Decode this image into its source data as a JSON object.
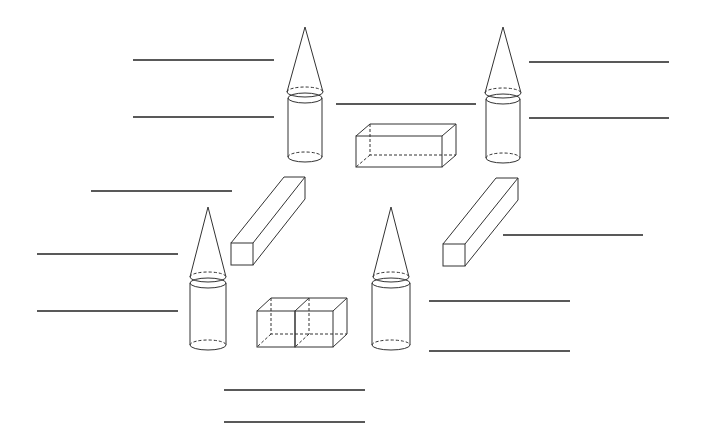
{
  "diagram": {
    "stroke_color": "#333333",
    "background": "#ffffff",
    "shapes": [
      {
        "id": "cone-top-left",
        "type": "cone",
        "apex": [
          305,
          27
        ],
        "base_center": [
          305,
          92
        ],
        "rx": 18,
        "ry": 5
      },
      {
        "id": "cylinder-top-left",
        "type": "cylinder",
        "top_center": [
          305,
          98
        ],
        "bottom_center": [
          305,
          157
        ],
        "rx": 17,
        "ry": 5
      },
      {
        "id": "cone-top-right",
        "type": "cone",
        "apex": [
          503,
          27
        ],
        "base_center": [
          503,
          93
        ],
        "rx": 18,
        "ry": 5
      },
      {
        "id": "cylinder-top-right",
        "type": "cylinder",
        "top_center": [
          503,
          99
        ],
        "bottom_center": [
          503,
          158
        ],
        "rx": 17,
        "ry": 5
      },
      {
        "id": "cone-bottom-left",
        "type": "cone",
        "apex": [
          208,
          207
        ],
        "base_center": [
          208,
          277
        ],
        "rx": 18,
        "ry": 5
      },
      {
        "id": "cylinder-bottom-left",
        "type": "cylinder",
        "top_center": [
          208,
          283
        ],
        "bottom_center": [
          208,
          345
        ],
        "rx": 18,
        "ry": 5
      },
      {
        "id": "cone-bottom-right",
        "type": "cone",
        "apex": [
          391,
          207
        ],
        "base_center": [
          391,
          277
        ],
        "rx": 18,
        "ry": 5
      },
      {
        "id": "cylinder-bottom-right",
        "type": "cylinder",
        "top_center": [
          391,
          283
        ],
        "bottom_center": [
          391,
          345
        ],
        "rx": 19,
        "ry": 5
      },
      {
        "id": "rectangular-prism-center",
        "type": "rectangular-prism"
      },
      {
        "id": "long-prism-left",
        "type": "square-prism"
      },
      {
        "id": "long-prism-right",
        "type": "square-prism"
      },
      {
        "id": "double-cube",
        "type": "two-cubes"
      }
    ],
    "answer_lines": [
      {
        "x1": 133,
        "y1": 60,
        "x2": 274,
        "y2": 60
      },
      {
        "x1": 133,
        "y1": 117,
        "x2": 274,
        "y2": 117
      },
      {
        "x1": 91,
        "y1": 191,
        "x2": 232,
        "y2": 191
      },
      {
        "x1": 37,
        "y1": 254,
        "x2": 178,
        "y2": 254
      },
      {
        "x1": 37,
        "y1": 311,
        "x2": 178,
        "y2": 311
      },
      {
        "x1": 336,
        "y1": 104,
        "x2": 476,
        "y2": 104
      },
      {
        "x1": 529,
        "y1": 62,
        "x2": 669,
        "y2": 62
      },
      {
        "x1": 529,
        "y1": 118,
        "x2": 669,
        "y2": 118
      },
      {
        "x1": 503,
        "y1": 235,
        "x2": 643,
        "y2": 235
      },
      {
        "x1": 429,
        "y1": 301,
        "x2": 570,
        "y2": 301
      },
      {
        "x1": 429,
        "y1": 351,
        "x2": 570,
        "y2": 351
      },
      {
        "x1": 224,
        "y1": 390,
        "x2": 365,
        "y2": 390
      },
      {
        "x1": 224,
        "y1": 422,
        "x2": 365,
        "y2": 422
      }
    ]
  }
}
